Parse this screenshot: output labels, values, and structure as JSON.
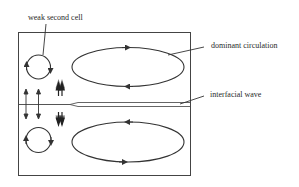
{
  "diagram": {
    "type": "flow-circulation-schematic",
    "labels": {
      "weak_second_cell": "weak second cell",
      "dominant_circulation": "dominant circulation",
      "interfacial_wave": "interfacial wave"
    },
    "colors": {
      "stroke": "#333333",
      "background": "#ffffff",
      "text": "#2a2a2a"
    },
    "elements": {
      "upper_dominant_cell": {
        "rotation": "clockwise"
      },
      "lower_dominant_cell": {
        "rotation": "counter-clockwise"
      },
      "upper_weak_cell": {
        "rotation": "clockwise"
      },
      "lower_weak_cell": {
        "rotation": "clockwise"
      },
      "single_arrows": "bidirectional vertical arrows at left (up/down)",
      "double_arrows": "paired arrows converging toward interface"
    }
  }
}
